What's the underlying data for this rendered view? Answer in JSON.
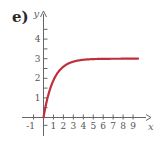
{
  "panel_label": "e)",
  "chart_data": {
    "type": "line",
    "title": "",
    "xlabel": "x",
    "ylabel": "y",
    "xlim": [
      -1.5,
      10
    ],
    "ylim": [
      -1,
      5
    ],
    "x_ticks": [
      "-1",
      "1",
      "2",
      "3",
      "4",
      "5",
      "6",
      "7",
      "8",
      "9"
    ],
    "y_ticks": [
      "1",
      "2",
      "3",
      "4"
    ],
    "grid": false,
    "series": [
      {
        "name": "curve",
        "color": "#c0303a",
        "x": [
          0,
          0.5,
          1,
          1.5,
          2,
          2.5,
          3,
          4,
          5,
          6,
          7,
          8,
          9,
          9.5
        ],
        "values": [
          0,
          1.18,
          1.9,
          2.33,
          2.59,
          2.75,
          2.85,
          2.95,
          2.98,
          2.99,
          3.0,
          3.0,
          3.0,
          3.0
        ]
      }
    ],
    "asymptote": 3
  },
  "axes": {
    "x_label": "x",
    "y_label": "y",
    "x_tick_labels": [
      "-1",
      "1",
      "2",
      "3",
      "4",
      "5",
      "6",
      "7",
      "8",
      "9"
    ],
    "y_tick_labels": [
      "1",
      "2",
      "3",
      "4"
    ]
  }
}
